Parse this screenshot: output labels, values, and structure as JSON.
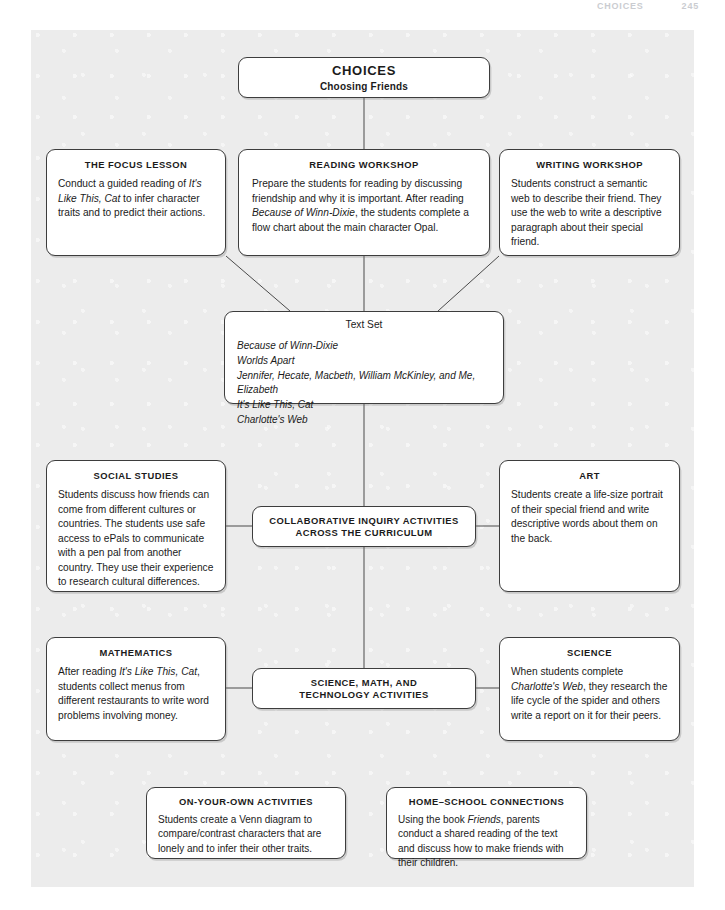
{
  "running_head": {
    "chapter": "CHOICES",
    "page_number": "245"
  },
  "diagram": {
    "root": {
      "title": "CHOICES",
      "subtitle": "Choosing Friends"
    },
    "focus_lesson": {
      "heading": "THE FOCUS LESSON",
      "body_pre": "Conduct a guided reading of ",
      "body_italic": "It's Like This, Cat",
      "body_post": " to infer character traits and to predict their actions."
    },
    "reading_workshop": {
      "heading": "READING WORKSHOP",
      "body_pre": "Prepare the students for reading by discussing friendship and why it is important. After reading ",
      "body_italic": "Because of Winn-Dixie",
      "body_post": ", the students complete a flow chart about the main character Opal."
    },
    "writing_workshop": {
      "heading": "WRITING WORKSHOP",
      "body": "Students construct a semantic web to describe their friend. They use the web to write a descriptive paragraph about their special friend."
    },
    "text_set": {
      "heading": "Text Set",
      "items": [
        "Because of Winn-Dixie",
        "Worlds Apart",
        "Jennifer, Hecate, Macbeth, William McKinley, and Me, Elizabeth",
        "It's Like This, Cat",
        "Charlotte's Web"
      ]
    },
    "social_studies": {
      "heading": "SOCIAL STUDIES",
      "body": "Students discuss how friends can come from different cultures or countries. The students use safe access to ePals to communicate with a pen pal from another country. They use their experience to research cultural differences."
    },
    "art": {
      "heading": "ART",
      "body": "Students create a life-size portrait of their special friend and write descriptive words about them on the back."
    },
    "collaborative": {
      "line1": "COLLABORATIVE INQUIRY ACTIVITIES",
      "line2": "ACROSS THE CURRICULUM"
    },
    "mathematics": {
      "heading": "MATHEMATICS",
      "body_pre": "After reading ",
      "body_italic": "It's Like This, Cat",
      "body_post": ", students collect menus from different restaurants to write word problems involving money."
    },
    "science": {
      "heading": "SCIENCE",
      "body_pre": "When students complete ",
      "body_italic": "Charlotte's Web",
      "body_post": ", they research the life cycle of the spider and others write a report on it for their peers."
    },
    "science_math_tech": {
      "line1": "SCIENCE, MATH, AND",
      "line2": "TECHNOLOGY ACTIVITIES"
    },
    "on_your_own": {
      "heading": "ON-YOUR-OWN ACTIVITIES",
      "body": "Students create a Venn diagram to compare/contrast characters that are lonely and to infer their other traits."
    },
    "home_school": {
      "heading": "HOME–SCHOOL CONNECTIONS",
      "body_pre": "Using the book ",
      "body_italic": "Friends",
      "body_post": ", parents conduct a shared reading of the text and discuss how to make friends with their children."
    }
  },
  "colors": {
    "plate_background": "#ececec",
    "node_border": "#3d3d3d",
    "node_fill": "#ffffff",
    "text": "#1b1b1b",
    "connector": "#4a4a4a"
  }
}
